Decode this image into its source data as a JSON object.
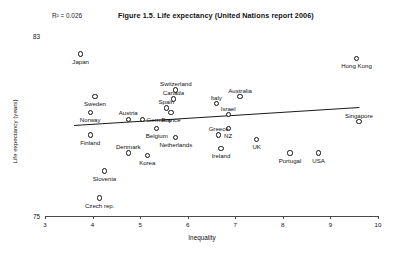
{
  "chart_data": {
    "type": "scatter",
    "title": "Figure 1.5. Life expectancy (United Nations report 2006)",
    "xlabel": "Inequality",
    "ylabel": "Life expectancy (years)",
    "xlim": [
      3,
      10
    ],
    "ylim": [
      75,
      83
    ],
    "xticks": [
      3,
      4,
      5,
      6,
      7,
      8,
      9,
      10
    ],
    "xtick_labels": [
      "3",
      "4",
      "5",
      "6",
      "7",
      "8",
      "9",
      "10"
    ],
    "ytick_labels": [
      "83",
      "75"
    ],
    "grid": false,
    "legend": false,
    "annotations": [
      {
        "name": "r-squared",
        "text": "R² = 0.026"
      }
    ],
    "trendline": {
      "present": true,
      "x_start": 3.6,
      "y_start": 79.05,
      "x_end": 9.6,
      "y_end": 79.85
    },
    "points": [
      {
        "label": "Japan",
        "x": 3.75,
        "y": 82.2,
        "label_pos": "below"
      },
      {
        "label": "Hong Kong",
        "x": 9.55,
        "y": 82.0,
        "label_pos": "below"
      },
      {
        "label": "Sweden",
        "x": 4.05,
        "y": 80.3,
        "label_pos": "below"
      },
      {
        "label": "Switzerland",
        "x": 5.75,
        "y": 80.6,
        "label_pos": "above"
      },
      {
        "label": "Canada",
        "x": 5.7,
        "y": 80.2,
        "label_pos": "above"
      },
      {
        "label": "Australia",
        "x": 7.1,
        "y": 80.3,
        "label_pos": "above"
      },
      {
        "label": "Italy",
        "x": 6.6,
        "y": 80.0,
        "label_pos": "above"
      },
      {
        "label": "Norway",
        "x": 3.95,
        "y": 79.6,
        "label_pos": "below"
      },
      {
        "label": "Spain",
        "x": 5.55,
        "y": 79.8,
        "label_pos": "above"
      },
      {
        "label": "France",
        "x": 5.65,
        "y": 79.6,
        "label_pos": "below"
      },
      {
        "label": "Austria",
        "x": 4.75,
        "y": 79.3,
        "label_pos": "above"
      },
      {
        "label": "Germany",
        "x": 5.05,
        "y": 79.3,
        "label_pos": "right"
      },
      {
        "label": "Israel",
        "x": 6.85,
        "y": 79.5,
        "label_pos": "above"
      },
      {
        "label": "Singapore",
        "x": 9.6,
        "y": 79.2,
        "label_pos": "above"
      },
      {
        "label": "Belgium",
        "x": 5.35,
        "y": 78.9,
        "label_pos": "below"
      },
      {
        "label": "NZ",
        "x": 6.85,
        "y": 78.9,
        "label_pos": "below"
      },
      {
        "label": "Finland",
        "x": 3.95,
        "y": 78.6,
        "label_pos": "below"
      },
      {
        "label": "Netherlands",
        "x": 5.75,
        "y": 78.5,
        "label_pos": "below"
      },
      {
        "label": "Greece",
        "x": 6.65,
        "y": 78.6,
        "label_pos": "above"
      },
      {
        "label": "UK",
        "x": 7.45,
        "y": 78.4,
        "label_pos": "below"
      },
      {
        "label": "Ireland",
        "x": 6.7,
        "y": 78.0,
        "label_pos": "below"
      },
      {
        "label": "Denmark",
        "x": 4.75,
        "y": 77.8,
        "label_pos": "above"
      },
      {
        "label": "Korea",
        "x": 5.15,
        "y": 77.7,
        "label_pos": "below"
      },
      {
        "label": "Portugal",
        "x": 8.15,
        "y": 77.8,
        "label_pos": "below"
      },
      {
        "label": "USA",
        "x": 8.75,
        "y": 77.8,
        "label_pos": "below"
      },
      {
        "label": "Slovenia",
        "x": 4.25,
        "y": 77.0,
        "label_pos": "below"
      },
      {
        "label": "Czech rep.",
        "x": 4.15,
        "y": 75.8,
        "label_pos": "below"
      }
    ]
  }
}
